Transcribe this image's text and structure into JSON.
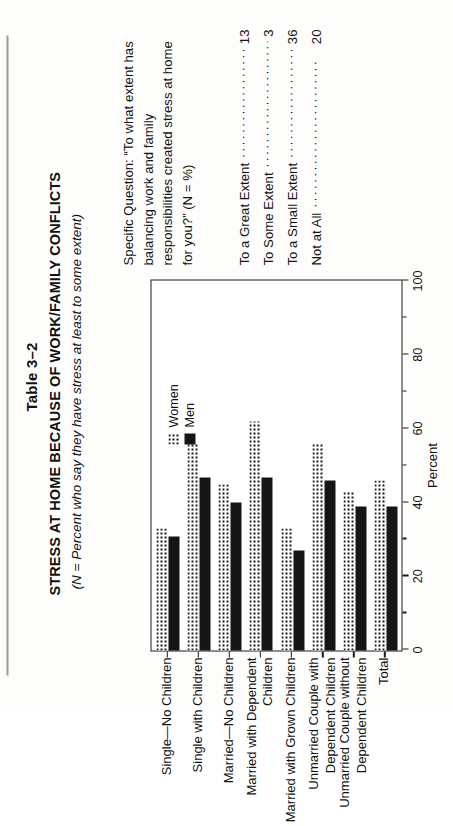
{
  "document": {
    "table_number": "Table 3–2",
    "title": "STRESS AT HOME BECAUSE OF WORK/FAMILY CONFLICTS",
    "subtitle": "(N = Percent who say they have stress at least to some extent)"
  },
  "note": {
    "question": "Specific Question: “To what extent has balancing work and family responsibilities created stress at home for you?” (N = %)",
    "responses": [
      {
        "label": "To a Great Extent",
        "dots": "························",
        "value": "13"
      },
      {
        "label": "To Some Extent",
        "dots": "························",
        "value": "3"
      },
      {
        "label": "To a Small Extent",
        "dots": "························",
        "value": "36"
      },
      {
        "label": "Not at All",
        "dots": "························",
        "value": "20"
      }
    ]
  },
  "chart_data": {
    "type": "bar",
    "orientation": "horizontal",
    "title": "STRESS AT HOME BECAUSE OF WORK/FAMILY CONFLICTS",
    "xlabel": "Percent",
    "ylabel": "",
    "xlim": [
      0,
      100
    ],
    "xticks": [
      0,
      20,
      40,
      60,
      80,
      100
    ],
    "xtick_labels": [
      "0",
      "20",
      "40",
      "60",
      "80",
      "100"
    ],
    "minor_ticks": [
      10,
      30,
      50,
      70,
      90
    ],
    "grid": false,
    "legend_position": "top-right",
    "categories": [
      "Single—No Children",
      "Single with Children",
      "Married—No Children",
      "Married with Dependent\nChildren",
      "Married with Grown Children",
      "Unmarried Couple with\nDependent Children",
      "Unmarried Couple without\nDependent Children",
      "Total"
    ],
    "series": [
      {
        "name": "Women",
        "values": [
          33,
          56,
          45,
          62,
          33,
          56,
          43,
          46
        ]
      },
      {
        "name": "Men",
        "values": [
          31,
          47,
          40,
          47,
          27,
          46,
          39,
          39
        ]
      }
    ]
  }
}
